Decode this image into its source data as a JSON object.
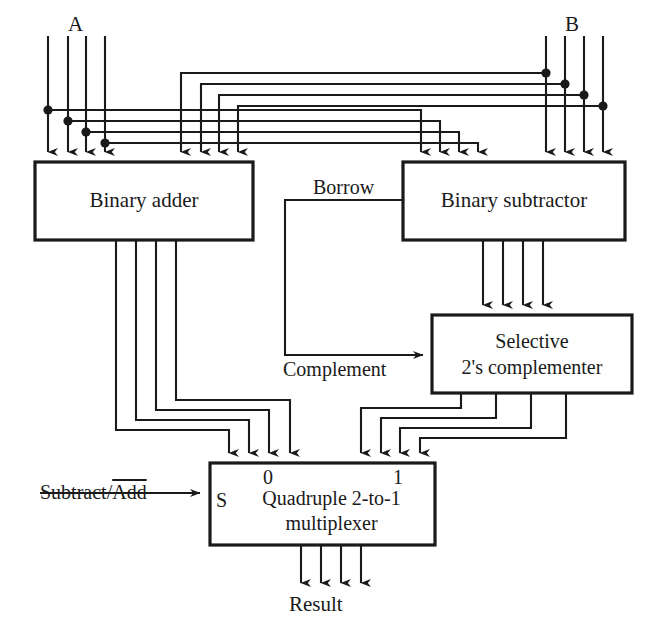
{
  "diagram": {
    "colors": {
      "line": "#1a1a1a",
      "background": "#ffffff",
      "text": "#1a1a1a"
    },
    "blocks": [
      {
        "id": "binary-adder",
        "label": "Binary adder",
        "x": 35,
        "y": 162,
        "w": 218,
        "h": 78,
        "inputs": 8,
        "outputs": 4
      },
      {
        "id": "binary-subtractor",
        "label": "Binary subtractor",
        "x": 403,
        "y": 162,
        "w": 222,
        "h": 78,
        "inputs": 8,
        "outputs": 4
      },
      {
        "id": "selective-2s-complementer",
        "label": "Selective\n2's complementer",
        "label_line1": "Selective",
        "label_line2": "2's complementer",
        "x": 432,
        "y": 315,
        "w": 200,
        "h": 78,
        "inputs": 4,
        "outputs": 4
      },
      {
        "id": "quadruple-multiplexer",
        "label": "Quadruple 2-to-1\nmultiplexer",
        "label_line1": "Quadruple 2-to-1",
        "label_line2": "multiplexer",
        "x": 210,
        "y": 463,
        "w": 225,
        "h": 82,
        "inputs": 8,
        "outputs": 4
      }
    ],
    "signals": {
      "input_a": "A",
      "input_b": "B",
      "borrow": "Borrow",
      "complement": "Complement",
      "select_prefix": "Subtract/",
      "select_overlined": "Add",
      "select_full": "Subtract/Add",
      "select_pin": "S",
      "mux_port_0": "0",
      "mux_port_1": "1",
      "output": "Result"
    },
    "bus_width": 4
  }
}
